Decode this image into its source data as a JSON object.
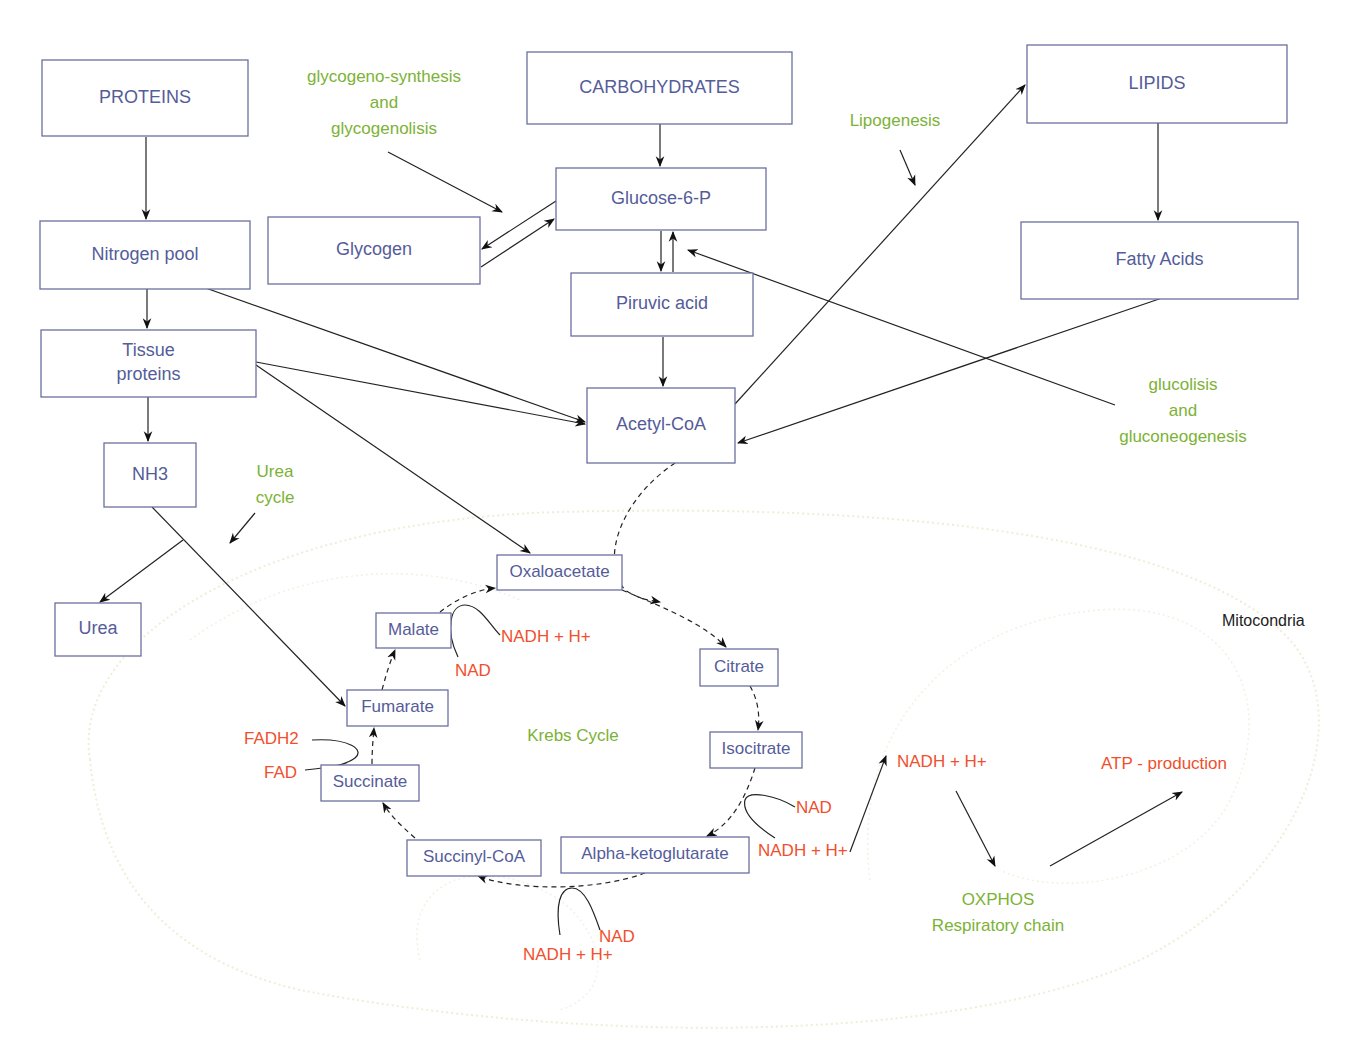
{
  "diagram": {
    "colors": {
      "box_stroke": "#6a6f9e",
      "box_text": "#555c9a",
      "process_text": "#7cb236",
      "cofactor_text": "#f0502e",
      "edge": "#222222",
      "membrane": "#f0ecd8"
    },
    "nodes": [
      {
        "id": "proteins",
        "label": "PROTEINS",
        "x": 42,
        "y": 60,
        "w": 206,
        "h": 76,
        "fs": 18
      },
      {
        "id": "carbohydrates",
        "label": "CARBOHYDRATES",
        "x": 527,
        "y": 52,
        "w": 265,
        "h": 72,
        "fs": 18
      },
      {
        "id": "lipids",
        "label": "LIPIDS",
        "x": 1027,
        "y": 45,
        "w": 260,
        "h": 78,
        "fs": 18
      },
      {
        "id": "glucose6p",
        "label": "Glucose-6-P",
        "x": 556,
        "y": 168,
        "w": 210,
        "h": 62,
        "fs": 18
      },
      {
        "id": "glycogen",
        "label": "Glycogen",
        "x": 268,
        "y": 217,
        "w": 212,
        "h": 67,
        "fs": 18
      },
      {
        "id": "nitrogen_pool",
        "label": "Nitrogen pool",
        "x": 40,
        "y": 221,
        "w": 210,
        "h": 68,
        "fs": 18
      },
      {
        "id": "fatty_acids",
        "label": "Fatty Acids",
        "x": 1021,
        "y": 222,
        "w": 277,
        "h": 77,
        "fs": 18
      },
      {
        "id": "piruvic_acid",
        "label": "Piruvic acid",
        "x": 571,
        "y": 273,
        "w": 182,
        "h": 63,
        "fs": 18
      },
      {
        "id": "tissue_proteins",
        "label": "Tissue\nproteins",
        "x": 41,
        "y": 330,
        "w": 215,
        "h": 67,
        "fs": 18
      },
      {
        "id": "acetyl_coa",
        "label": "Acetyl-CoA",
        "x": 587,
        "y": 388,
        "w": 148,
        "h": 75,
        "fs": 18
      },
      {
        "id": "nh3",
        "label": "NH3",
        "x": 104,
        "y": 443,
        "w": 92,
        "h": 64,
        "fs": 18
      },
      {
        "id": "urea",
        "label": "Urea",
        "x": 55,
        "y": 603,
        "w": 86,
        "h": 53,
        "fs": 18
      },
      {
        "id": "oxaloacetate",
        "label": "Oxaloacetate",
        "x": 497,
        "y": 555,
        "w": 125,
        "h": 35,
        "fs": 17
      },
      {
        "id": "malate",
        "label": "Malate",
        "x": 376,
        "y": 613,
        "w": 75,
        "h": 35,
        "fs": 17
      },
      {
        "id": "citrate",
        "label": "Citrate",
        "x": 700,
        "y": 649,
        "w": 78,
        "h": 37,
        "fs": 17
      },
      {
        "id": "fumarate",
        "label": "Fumarate",
        "x": 347,
        "y": 690,
        "w": 101,
        "h": 36,
        "fs": 17
      },
      {
        "id": "isocitrate",
        "label": "Isocitrate",
        "x": 710,
        "y": 732,
        "w": 92,
        "h": 36,
        "fs": 17
      },
      {
        "id": "succinate",
        "label": "Succinate",
        "x": 321,
        "y": 765,
        "w": 98,
        "h": 36,
        "fs": 17
      },
      {
        "id": "succinyl_coa",
        "label": "Succinyl-CoA",
        "x": 407,
        "y": 840,
        "w": 134,
        "h": 36,
        "fs": 17
      },
      {
        "id": "alpha_ketoglutarate",
        "label": "Alpha-ketoglutarate",
        "x": 561,
        "y": 837,
        "w": 188,
        "h": 36,
        "fs": 17
      }
    ],
    "process_labels": [
      {
        "id": "glycogen_process",
        "lines": [
          "glycogeno-synthesis",
          "and",
          "glycogenolisis"
        ],
        "x": 384,
        "y": 78,
        "lh": 26,
        "fs": 17
      },
      {
        "id": "lipogenesis",
        "lines": [
          "Lipogenesis"
        ],
        "x": 895,
        "y": 122,
        "lh": 24,
        "fs": 17
      },
      {
        "id": "glucolisis",
        "lines": [
          "glucolisis",
          "and",
          "gluconeogenesis"
        ],
        "x": 1183,
        "y": 386,
        "lh": 26,
        "fs": 17
      },
      {
        "id": "urea_cycle",
        "lines": [
          "Urea",
          "cycle"
        ],
        "x": 275,
        "y": 473,
        "lh": 26,
        "fs": 17
      },
      {
        "id": "krebs_cycle",
        "lines": [
          "Krebs Cycle"
        ],
        "x": 573,
        "y": 737,
        "lh": 24,
        "fs": 17
      },
      {
        "id": "oxphos",
        "lines": [
          "OXPHOS",
          "Respiratory chain"
        ],
        "x": 998,
        "y": 901,
        "lh": 26,
        "fs": 17
      }
    ],
    "cofactors": [
      {
        "id": "nadh_malate",
        "label": "NADH + H+",
        "x": 501,
        "y": 638,
        "anchor": "start"
      },
      {
        "id": "nad_malate",
        "label": "NAD",
        "x": 455,
        "y": 672,
        "anchor": "start"
      },
      {
        "id": "fadh2",
        "label": "FADH2",
        "x": 244,
        "y": 740,
        "anchor": "start"
      },
      {
        "id": "fad",
        "label": "FAD",
        "x": 264,
        "y": 774,
        "anchor": "start"
      },
      {
        "id": "nad_iso",
        "label": "NAD",
        "x": 796,
        "y": 809,
        "anchor": "start"
      },
      {
        "id": "nadh_iso",
        "label": "NADH + H+",
        "x": 758,
        "y": 852,
        "anchor": "start"
      },
      {
        "id": "nad_akg",
        "label": "NAD",
        "x": 599,
        "y": 938,
        "anchor": "start"
      },
      {
        "id": "nadh_akg",
        "label": "NADH + H+",
        "x": 523,
        "y": 956,
        "anchor": "start"
      },
      {
        "id": "nadh_oxphos",
        "label": "NADH + H+",
        "x": 897,
        "y": 763,
        "anchor": "start"
      },
      {
        "id": "atp",
        "label": "ATP - production",
        "x": 1101,
        "y": 765,
        "anchor": "start"
      }
    ],
    "region_labels": [
      {
        "id": "mitocondria",
        "label": "Mitocondria",
        "x": 1222,
        "y": 622
      }
    ]
  }
}
